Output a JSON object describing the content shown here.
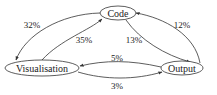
{
  "diagram": {
    "type": "flow-graph",
    "nodes": [
      {
        "id": "code",
        "label": "Code"
      },
      {
        "id": "visualisation",
        "label": "Visualisation"
      },
      {
        "id": "output",
        "label": "Output"
      }
    ],
    "edges": [
      {
        "from": "code",
        "to": "visualisation",
        "label": "32%"
      },
      {
        "from": "visualisation",
        "to": "code",
        "label": "35%"
      },
      {
        "from": "code",
        "to": "output",
        "label": "13%"
      },
      {
        "from": "output",
        "to": "code",
        "label": "12%"
      },
      {
        "from": "output",
        "to": "visualisation",
        "label": "5%"
      },
      {
        "from": "visualisation",
        "to": "output",
        "label": "3%"
      }
    ]
  },
  "colors": {
    "stroke": "#333333",
    "text": "#222222",
    "background": "#ffffff"
  }
}
